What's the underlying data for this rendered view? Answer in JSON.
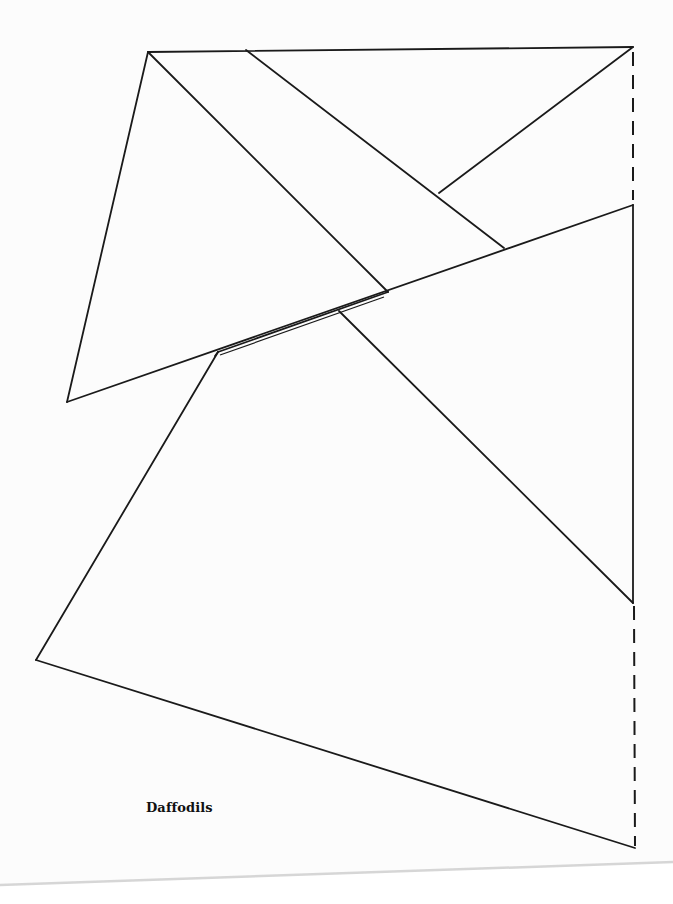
{
  "caption": "Daffodils",
  "colors": {
    "line": "#1a1a1a",
    "paper": "#fcfcfc",
    "page_edge_shadow": "#d8d8d8"
  },
  "diagram": {
    "solid_lines": [
      {
        "name": "top-edge",
        "x1": 148,
        "y1": 52,
        "x2": 633,
        "y2": 47
      },
      {
        "name": "left-triangle-left-edge",
        "x1": 148,
        "y1": 52,
        "x2": 67,
        "y2": 402
      },
      {
        "name": "long-diagonal",
        "x1": 67,
        "y1": 402,
        "x2": 633,
        "y2": 205
      },
      {
        "name": "diagonal-from-apex",
        "x1": 148,
        "y1": 52,
        "x2": 388,
        "y2": 292
      },
      {
        "name": "diagonal-second",
        "x1": 246,
        "y1": 50,
        "x2": 504,
        "y2": 248
      },
      {
        "name": "short-segment-top-right",
        "x1": 633,
        "y1": 47,
        "x2": 439,
        "y2": 193
      },
      {
        "name": "right-vertical",
        "x1": 633,
        "y1": 205,
        "x2": 633,
        "y2": 603
      },
      {
        "name": "inner-diagonal-lower",
        "x1": 339,
        "y1": 311,
        "x2": 633,
        "y2": 603
      },
      {
        "name": "double-line-upper",
        "x1": 218,
        "y1": 352,
        "x2": 388,
        "y2": 292
      },
      {
        "name": "lower-left-edge",
        "x1": 218,
        "y1": 352,
        "x2": 36,
        "y2": 660
      },
      {
        "name": "bottom-edge",
        "x1": 36,
        "y1": 660,
        "x2": 635,
        "y2": 848
      },
      {
        "name": "double-line-short",
        "x1": 215,
        "y1": 356,
        "x2": 218,
        "y2": 352
      }
    ],
    "dashed_lines": [
      {
        "name": "dashed-top-right",
        "x1": 633,
        "y1": 52,
        "x2": 633,
        "y2": 200
      },
      {
        "name": "dashed-bottom-right",
        "x1": 634,
        "y1": 606,
        "x2": 635,
        "y2": 846
      }
    ]
  }
}
